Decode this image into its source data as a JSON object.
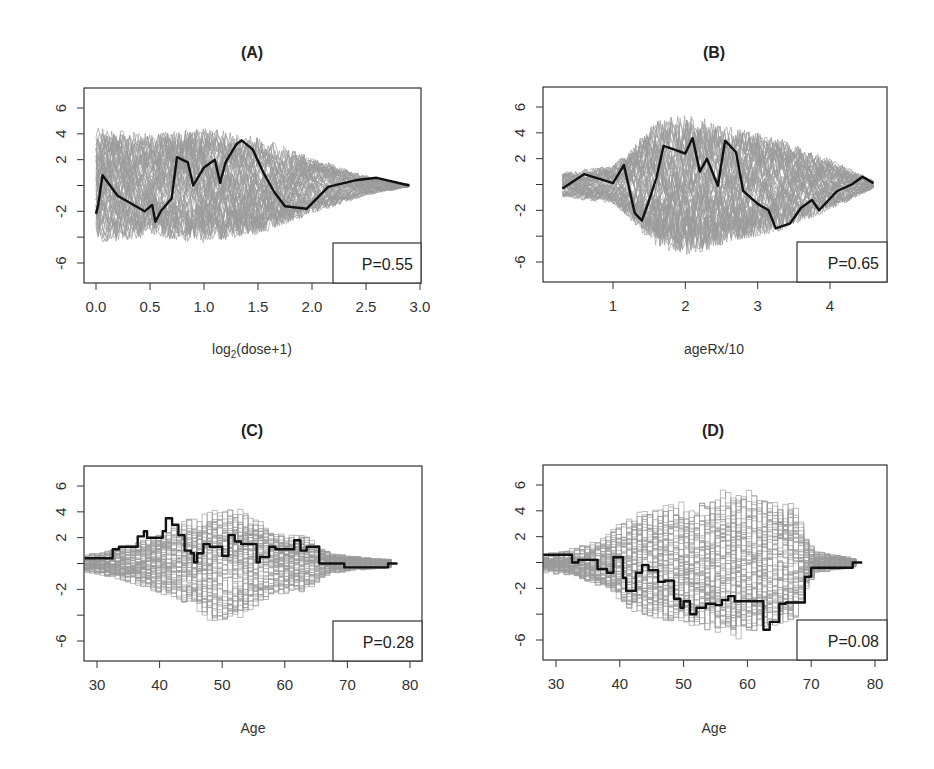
{
  "chart_data": [
    {
      "panel": "A",
      "type": "line",
      "title": "(A)",
      "xlabel": "log2(dose+1)",
      "xlabel_parts": {
        "base": "log",
        "sub": "2",
        "rest": "(dose+1)"
      },
      "ylabel": "",
      "xlim": [
        -0.1,
        3.05
      ],
      "ylim": [
        -7.2,
        7.2
      ],
      "xticks": [
        0.0,
        0.5,
        1.0,
        1.5,
        2.0,
        2.5,
        3.0
      ],
      "xtick_labels": [
        "0.0",
        "0.5",
        "1.0",
        "1.5",
        "2.0",
        "2.5",
        "3.0"
      ],
      "yticks": [
        6,
        4,
        2,
        0,
        -2,
        -4,
        -6
      ],
      "ytick_labels": [
        "6",
        "4",
        "2",
        "",
        "-2",
        "",
        "-6"
      ],
      "legend": "P=0.55",
      "step": false,
      "grey_envelope": {
        "x": [
          0.0,
          0.5,
          1.0,
          1.5,
          2.0,
          2.5,
          2.9
        ],
        "half_width": [
          4.5,
          4.0,
          4.5,
          3.8,
          2.2,
          0.8,
          0.1
        ]
      },
      "observed": {
        "x": [
          0.0,
          0.02,
          0.06,
          0.2,
          0.45,
          0.52,
          0.55,
          0.6,
          0.7,
          0.75,
          0.85,
          0.9,
          1.0,
          1.1,
          1.15,
          1.2,
          1.3,
          1.35,
          1.45,
          1.55,
          1.65,
          1.75,
          1.95,
          2.15,
          2.4,
          2.6,
          2.9
        ],
        "y": [
          -2.2,
          -1.5,
          0.8,
          -0.8,
          -2.0,
          -1.5,
          -2.8,
          -2.0,
          -1.0,
          2.2,
          1.8,
          0.0,
          1.4,
          2.0,
          0.2,
          1.8,
          3.2,
          3.5,
          2.8,
          1.0,
          -0.5,
          -1.6,
          -1.8,
          -0.1,
          0.4,
          0.6,
          0.0
        ]
      }
    },
    {
      "panel": "B",
      "type": "line",
      "title": "(B)",
      "xlabel": "ageRx/10",
      "ylabel": "",
      "xlim": [
        0.25,
        4.8
      ],
      "ylim": [
        -7.2,
        7.2
      ],
      "xticks": [
        1,
        2,
        3,
        4
      ],
      "xtick_labels": [
        "1",
        "2",
        "3",
        "4"
      ],
      "yticks": [
        6,
        4,
        2,
        0,
        -2,
        -4,
        -6
      ],
      "ytick_labels": [
        "6",
        "4",
        "2",
        "",
        "-2",
        "",
        "-6"
      ],
      "legend": "P=0.65",
      "step": false,
      "grey_envelope": {
        "x": [
          0.3,
          1.0,
          1.2,
          1.6,
          2.1,
          2.6,
          3.2,
          3.8,
          4.3,
          4.6
        ],
        "half_width": [
          1.0,
          1.5,
          2.5,
          5.0,
          5.5,
          4.5,
          3.8,
          2.5,
          1.2,
          0.3
        ]
      },
      "observed": {
        "x": [
          0.3,
          0.6,
          1.0,
          1.15,
          1.3,
          1.4,
          1.5,
          1.6,
          1.7,
          1.85,
          2.0,
          2.1,
          2.2,
          2.3,
          2.45,
          2.55,
          2.7,
          2.8,
          2.9,
          3.0,
          3.15,
          3.25,
          3.45,
          3.6,
          3.75,
          3.85,
          4.1,
          4.3,
          4.45,
          4.6
        ],
        "y": [
          -0.3,
          0.8,
          0.1,
          1.5,
          -2.2,
          -2.8,
          -1.2,
          0.5,
          3.0,
          2.7,
          2.4,
          3.6,
          1.0,
          2.0,
          -0.1,
          3.4,
          2.5,
          -0.5,
          -1.0,
          -1.5,
          -2.0,
          -3.4,
          -3.0,
          -1.8,
          -1.2,
          -2.0,
          -0.5,
          0.0,
          0.6,
          0.1
        ]
      }
    },
    {
      "panel": "C",
      "type": "line",
      "title": "(C)",
      "xlabel": "Age",
      "ylabel": "",
      "xlim": [
        28,
        82
      ],
      "ylim": [
        -7.2,
        7.2
      ],
      "xticks": [
        30,
        40,
        50,
        60,
        70,
        80
      ],
      "xtick_labels": [
        "30",
        "40",
        "50",
        "60",
        "70",
        "80"
      ],
      "yticks": [
        6,
        4,
        2,
        0,
        -2,
        -4,
        -6
      ],
      "ytick_labels": [
        "6",
        "4",
        "2",
        "",
        "-2",
        "",
        "-6"
      ],
      "legend": "P=0.28",
      "step": true,
      "grey_envelope": {
        "x": [
          28,
          33,
          38,
          43,
          48,
          53,
          58,
          63,
          66,
          70,
          77
        ],
        "half_width": [
          0.7,
          1.2,
          2.0,
          3.2,
          4.5,
          4.2,
          2.5,
          2.2,
          1.0,
          0.6,
          0.3
        ]
      },
      "observed": {
        "x": [
          28,
          32.5,
          33.5,
          36.5,
          37.5,
          38,
          40.5,
          41,
          42,
          43,
          44,
          45,
          45.5,
          46,
          47,
          48,
          50,
          51,
          52,
          53,
          55.5,
          56,
          57.5,
          58.5,
          61.5,
          62.5,
          63.5,
          65.5,
          69.5,
          76.5,
          78
        ],
        "y": [
          0.4,
          1.1,
          1.3,
          2.1,
          2.5,
          2.0,
          2.5,
          3.5,
          3.0,
          2.2,
          1.0,
          0.8,
          0.1,
          0.8,
          1.5,
          1.3,
          0.6,
          2.2,
          1.7,
          1.5,
          0.1,
          0.5,
          1.3,
          1.1,
          1.8,
          1.0,
          1.3,
          0.0,
          -0.3,
          0.0,
          0.0
        ]
      }
    },
    {
      "panel": "D",
      "type": "line",
      "title": "(D)",
      "xlabel": "Age",
      "ylabel": "",
      "xlim": [
        28,
        82
      ],
      "ylim": [
        -7.2,
        7.2
      ],
      "xticks": [
        30,
        40,
        50,
        60,
        70,
        80
      ],
      "xtick_labels": [
        "30",
        "40",
        "50",
        "60",
        "70",
        "80"
      ],
      "yticks": [
        6,
        4,
        2,
        0,
        -2,
        -4,
        -6
      ],
      "ytick_labels": [
        "6",
        "4",
        "2",
        "",
        "-2",
        "",
        "-6"
      ],
      "legend": "P=0.08",
      "step": true,
      "grey_envelope": {
        "x": [
          28,
          33,
          37,
          42,
          47,
          52,
          58,
          63,
          67,
          70,
          77
        ],
        "half_width": [
          0.8,
          1.2,
          2.0,
          4.0,
          4.5,
          5.0,
          6.0,
          5.0,
          4.5,
          0.9,
          0.3
        ]
      },
      "observed": {
        "x": [
          28,
          32.5,
          33.5,
          36.5,
          38,
          39,
          40.5,
          41,
          42.5,
          43.5,
          44.5,
          46,
          47,
          48.5,
          49.5,
          50,
          51,
          52,
          53.5,
          55,
          56,
          57,
          58,
          59,
          62.5,
          63.5,
          65,
          66,
          69,
          70,
          76.5,
          78
        ],
        "y": [
          0.6,
          0.0,
          0.2,
          -0.5,
          -0.8,
          0.4,
          -1.2,
          -2.2,
          -0.8,
          -0.2,
          -0.6,
          -1.5,
          -1.4,
          -2.8,
          -3.5,
          -3.0,
          -4.0,
          -3.5,
          -3.2,
          -3.3,
          -2.9,
          -2.6,
          -3.0,
          -3.0,
          -5.2,
          -4.6,
          -3.2,
          -3.1,
          -1.1,
          -0.4,
          0.0,
          0.0
        ]
      }
    }
  ]
}
